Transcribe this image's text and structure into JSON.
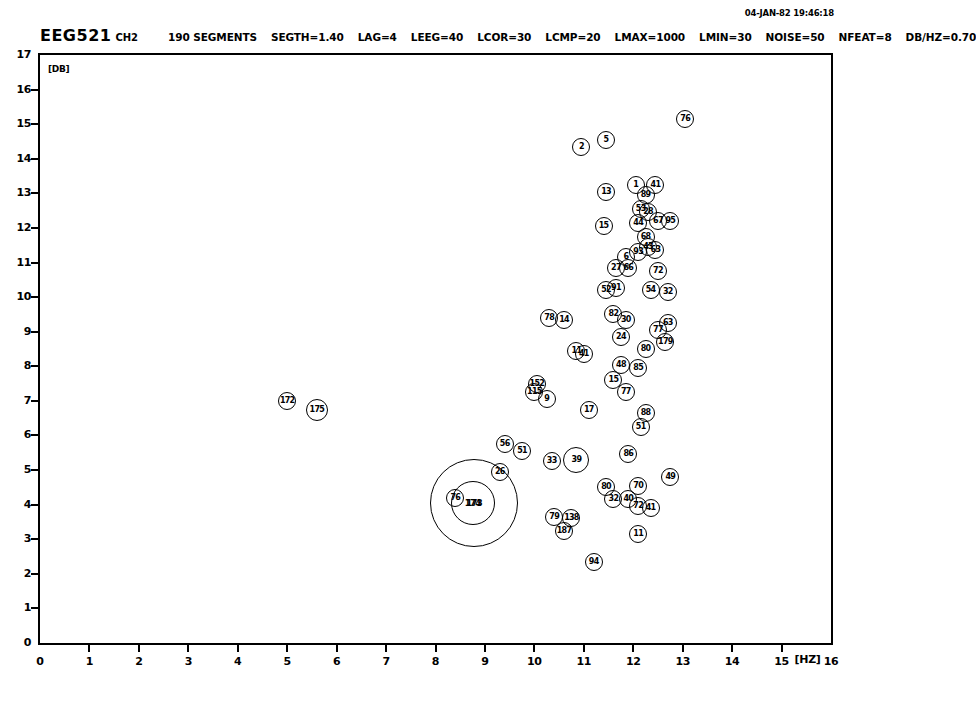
{
  "header": {
    "timestamp": "04-JAN-82 19:46:18",
    "dataset": "EEG521",
    "channel": "CH2",
    "segments": "190 SEGMENTS",
    "params": [
      "SEGTH=1.40",
      "LAG=4",
      "LEEG=40",
      "LCOR=30",
      "LCMP=20",
      "LMAX=1000",
      "LMIN=30",
      "NOISE=50",
      "NFEAT=8",
      "DB/HZ=0.70"
    ]
  },
  "chart_data": {
    "type": "scatter",
    "xlabel": "[HZ]",
    "ylabel": "[DB]",
    "xlim": [
      0,
      16
    ],
    "ylim": [
      0,
      17
    ],
    "xticks": [
      0,
      1,
      2,
      3,
      4,
      5,
      6,
      7,
      8,
      9,
      10,
      11,
      12,
      13,
      14,
      15,
      16
    ],
    "yticks": [
      0,
      1,
      2,
      3,
      4,
      5,
      6,
      7,
      8,
      9,
      10,
      11,
      12,
      13,
      14,
      15,
      16,
      17
    ],
    "grid": false,
    "legend": null,
    "marker": "numbered-circle",
    "n_points": 190,
    "points": [
      {
        "label": "76",
        "x": 13.05,
        "y": 15.15,
        "r": 9
      },
      {
        "label": "5",
        "x": 11.45,
        "y": 14.55,
        "r": 9
      },
      {
        "label": "2",
        "x": 10.95,
        "y": 14.35,
        "r": 9
      },
      {
        "label": "1",
        "x": 12.05,
        "y": 13.25,
        "r": 9
      },
      {
        "label": "41",
        "x": 12.45,
        "y": 13.25,
        "r": 9
      },
      {
        "label": "13",
        "x": 11.45,
        "y": 13.05,
        "r": 9
      },
      {
        "label": "89",
        "x": 12.25,
        "y": 12.95,
        "r": 9
      },
      {
        "label": "53",
        "x": 12.15,
        "y": 12.55,
        "r": 9
      },
      {
        "label": "28",
        "x": 12.3,
        "y": 12.45,
        "r": 9
      },
      {
        "label": "67",
        "x": 12.5,
        "y": 12.2,
        "r": 9
      },
      {
        "label": "95",
        "x": 12.75,
        "y": 12.2,
        "r": 9
      },
      {
        "label": "44",
        "x": 12.1,
        "y": 12.15,
        "r": 9
      },
      {
        "label": "15",
        "x": 11.4,
        "y": 12.05,
        "r": 9
      },
      {
        "label": "68",
        "x": 12.25,
        "y": 11.75,
        "r": 9
      },
      {
        "label": "63",
        "x": 12.45,
        "y": 11.35,
        "r": 9
      },
      {
        "label": "43",
        "x": 12.3,
        "y": 11.45,
        "r": 9
      },
      {
        "label": "93",
        "x": 12.1,
        "y": 11.3,
        "r": 9
      },
      {
        "label": "6",
        "x": 11.85,
        "y": 11.15,
        "r": 9
      },
      {
        "label": "27",
        "x": 11.65,
        "y": 10.85,
        "r": 9
      },
      {
        "label": "66",
        "x": 11.9,
        "y": 10.85,
        "r": 9
      },
      {
        "label": "72",
        "x": 12.5,
        "y": 10.75,
        "r": 9
      },
      {
        "label": "52",
        "x": 11.45,
        "y": 10.2,
        "r": 9
      },
      {
        "label": "91",
        "x": 11.65,
        "y": 10.25,
        "r": 9
      },
      {
        "label": "54",
        "x": 12.35,
        "y": 10.2,
        "r": 9
      },
      {
        "label": "32",
        "x": 12.7,
        "y": 10.15,
        "r": 9
      },
      {
        "label": "78",
        "x": 10.3,
        "y": 9.4,
        "r": 9
      },
      {
        "label": "14",
        "x": 10.6,
        "y": 9.35,
        "r": 9
      },
      {
        "label": "82",
        "x": 11.6,
        "y": 9.5,
        "r": 9
      },
      {
        "label": "30",
        "x": 11.85,
        "y": 9.35,
        "r": 9
      },
      {
        "label": "77",
        "x": 12.5,
        "y": 9.05,
        "r": 9
      },
      {
        "label": "63",
        "x": 12.7,
        "y": 9.25,
        "r": 9
      },
      {
        "label": "24",
        "x": 11.75,
        "y": 8.85,
        "r": 9
      },
      {
        "label": "179",
        "x": 12.65,
        "y": 8.7,
        "r": 9
      },
      {
        "label": "11",
        "x": 10.85,
        "y": 8.45,
        "r": 9
      },
      {
        "label": "41",
        "x": 11.0,
        "y": 8.35,
        "r": 9
      },
      {
        "label": "80",
        "x": 12.25,
        "y": 8.5,
        "r": 9
      },
      {
        "label": "48",
        "x": 11.75,
        "y": 8.05,
        "r": 9
      },
      {
        "label": "85",
        "x": 12.1,
        "y": 7.95,
        "r": 9
      },
      {
        "label": "152",
        "x": 10.05,
        "y": 7.5,
        "r": 9
      },
      {
        "label": "115",
        "x": 10.0,
        "y": 7.25,
        "r": 9
      },
      {
        "label": "9",
        "x": 10.25,
        "y": 7.05,
        "r": 9
      },
      {
        "label": "77",
        "x": 11.85,
        "y": 7.25,
        "r": 9
      },
      {
        "label": "15",
        "x": 11.6,
        "y": 7.6,
        "r": 9
      },
      {
        "label": "172",
        "x": 5.0,
        "y": 7.0,
        "r": 9
      },
      {
        "label": "175",
        "x": 5.6,
        "y": 6.75,
        "r": 11
      },
      {
        "label": "17",
        "x": 11.1,
        "y": 6.75,
        "r": 9
      },
      {
        "label": "88",
        "x": 12.25,
        "y": 6.65,
        "r": 9
      },
      {
        "label": "51",
        "x": 12.15,
        "y": 6.25,
        "r": 9
      },
      {
        "label": "86",
        "x": 11.9,
        "y": 5.45,
        "r": 9
      },
      {
        "label": "56",
        "x": 9.4,
        "y": 5.75,
        "r": 9
      },
      {
        "label": "51",
        "x": 9.75,
        "y": 5.55,
        "r": 9
      },
      {
        "label": "33",
        "x": 10.35,
        "y": 5.25,
        "r": 9
      },
      {
        "label": "39",
        "x": 10.85,
        "y": 5.3,
        "r": 13
      },
      {
        "label": "26",
        "x": 9.3,
        "y": 4.95,
        "r": 9
      },
      {
        "label": "49",
        "x": 12.75,
        "y": 4.8,
        "r": 9
      },
      {
        "label": "80",
        "x": 11.45,
        "y": 4.5,
        "r": 9
      },
      {
        "label": "70",
        "x": 12.1,
        "y": 4.55,
        "r": 9
      },
      {
        "label": "32",
        "x": 11.6,
        "y": 4.15,
        "r": 9
      },
      {
        "label": "40",
        "x": 11.9,
        "y": 4.15,
        "r": 9
      },
      {
        "label": "72",
        "x": 12.1,
        "y": 3.95,
        "r": 9
      },
      {
        "label": "41",
        "x": 12.35,
        "y": 3.9,
        "r": 9
      },
      {
        "label": "76",
        "x": 8.4,
        "y": 4.2,
        "r": 9
      },
      {
        "label": "174",
        "x": 8.75,
        "y": 4.05,
        "r": 22
      },
      {
        "label": "173",
        "x": 8.78,
        "y": 4.05,
        "r": 44
      },
      {
        "label": "79",
        "x": 10.4,
        "y": 3.65,
        "r": 9
      },
      {
        "label": "138",
        "x": 10.75,
        "y": 3.6,
        "r": 9
      },
      {
        "label": "187",
        "x": 10.6,
        "y": 3.25,
        "r": 9
      },
      {
        "label": "11",
        "x": 12.1,
        "y": 3.15,
        "r": 9
      },
      {
        "label": "94",
        "x": 11.2,
        "y": 2.35,
        "r": 9
      }
    ]
  }
}
